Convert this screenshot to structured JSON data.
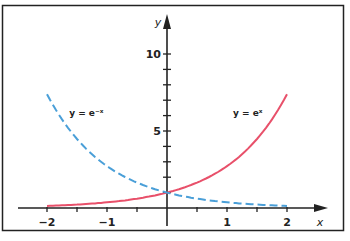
{
  "chart_data": {
    "type": "line",
    "title": "",
    "xlabel": "x",
    "ylabel": "y",
    "xlim": [
      -2,
      2
    ],
    "ylim": [
      0,
      11
    ],
    "grid": false,
    "legend": "inline labels",
    "x_ticks": [
      -2,
      -1.5,
      -1,
      -0.5,
      0,
      0.5,
      1,
      1.5,
      2
    ],
    "x_tick_labels": [
      {
        "value": -2,
        "label": "−2"
      },
      {
        "value": -1,
        "label": "−1"
      },
      {
        "value": 1,
        "label": "1"
      },
      {
        "value": 2,
        "label": "2"
      }
    ],
    "y_ticks": [
      1,
      2,
      3,
      4,
      5,
      6,
      7,
      8,
      9,
      10
    ],
    "y_tick_labels": [
      {
        "value": 5,
        "label": "5"
      },
      {
        "value": 10,
        "label": "10"
      }
    ],
    "series": [
      {
        "name": "y = e^x",
        "label": "y = eˣ",
        "color": "#e8506a",
        "style": "solid",
        "x": [
          -2,
          -1.5,
          -1,
          -0.5,
          0,
          0.5,
          1,
          1.5,
          2
        ],
        "values": [
          0.135,
          0.223,
          0.368,
          0.607,
          1.0,
          1.649,
          2.718,
          4.482,
          7.389
        ]
      },
      {
        "name": "y = e^-x",
        "label": "y = e⁻ˣ",
        "color": "#4a9fd8",
        "style": "dashed",
        "x": [
          -2,
          -1.5,
          -1,
          -0.5,
          0,
          0.5,
          1,
          1.5,
          2
        ],
        "values": [
          7.389,
          4.482,
          2.718,
          1.649,
          1.0,
          0.607,
          0.368,
          0.223,
          0.135
        ]
      }
    ],
    "annotations": [
      {
        "text": "y = e⁻ˣ",
        "x": -1.63,
        "y": 6.2
      },
      {
        "text": "y = eˣ",
        "x": 1.1,
        "y": 6.2
      }
    ]
  },
  "frame": {
    "border_color": "#222222"
  }
}
